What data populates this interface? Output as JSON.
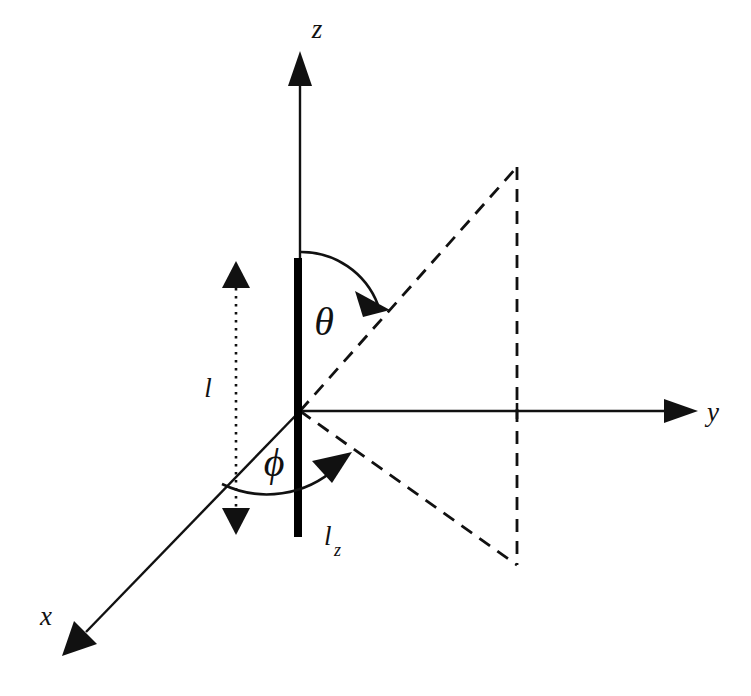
{
  "figure": {
    "type": "spherical-coordinate-dipole-diagram",
    "background_color": "#ffffff",
    "stroke_color": "#111111",
    "page_number": "7",
    "caption_partial": ""
  },
  "axes": {
    "z": {
      "label": "z",
      "label_x": 317,
      "label_y": 38,
      "line_from": [
        300,
        411
      ],
      "line_to": [
        300,
        72
      ],
      "arrow_tip": [
        300,
        52
      ]
    },
    "y": {
      "label": "y",
      "label_x": 712,
      "label_y": 420,
      "line_from": [
        300,
        411
      ],
      "line_to": [
        672,
        411
      ],
      "arrow_tip": [
        697,
        411
      ]
    },
    "x": {
      "label": "x",
      "label_x": 45,
      "label_y": 625,
      "line_from": [
        300,
        411
      ],
      "line_to": [
        84,
        634
      ],
      "arrow_tip": [
        62,
        656
      ]
    }
  },
  "origin": [
    300,
    411
  ],
  "dipole": {
    "label": "l_z",
    "label_text": "l",
    "label_subscript": "z",
    "label_x": 326,
    "label_y": 548,
    "bar_center_x": 298,
    "bar_top_y": 258,
    "bar_bottom_y": 537,
    "bar_width": 8,
    "color": "#000000"
  },
  "length_marker": {
    "label": "l",
    "label_x": 206,
    "label_y": 396,
    "line_x": 236,
    "top_y": 262,
    "bottom_y": 534,
    "style": "dotted-double-arrow"
  },
  "angles": {
    "theta": {
      "label": "θ",
      "label_x": 312,
      "label_y": 333,
      "description": "polar angle from z-axis to the dashed projection ray",
      "arc_start": [
        300,
        252
      ],
      "arc_end": [
        380,
        302
      ],
      "arrow_tip": [
        388,
        308
      ]
    },
    "phi": {
      "label": "ϕ",
      "label_x": 262,
      "label_y": 474,
      "description": "azimuthal angle from x-axis to the lower dashed ray",
      "arc_start": [
        222,
        484
      ],
      "arc_end": [
        340,
        463
      ],
      "arrow_tip": [
        350,
        455
      ]
    }
  },
  "dashed_construction": {
    "upper_ray": {
      "from": [
        300,
        411
      ],
      "to": [
        517,
        167
      ]
    },
    "lower_ray": {
      "from": [
        300,
        411
      ],
      "to": [
        517,
        565
      ]
    },
    "vertical": {
      "from": [
        517,
        167
      ],
      "to": [
        517,
        565
      ]
    },
    "tick_on_y_axis_x": 517
  }
}
